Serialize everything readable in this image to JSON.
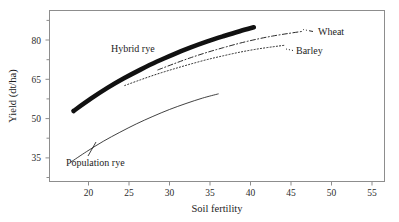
{
  "chart_data": {
    "type": "line",
    "title": "",
    "xlabel": "Soil fertility",
    "ylabel": "Yield (dt/ha)",
    "xlim": [
      16.5,
      57
    ],
    "ylim": [
      29,
      86
    ],
    "xticks": [
      20,
      25,
      30,
      35,
      40,
      45,
      50,
      55
    ],
    "xticklabels": [
      "20",
      "25",
      "30",
      "35",
      "40",
      "45",
      "50",
      "55"
    ],
    "yticks": [
      35,
      50,
      65,
      80
    ],
    "yticklabels": [
      "35",
      "50",
      "65",
      "80"
    ],
    "minor_yticks": [
      42.5,
      57.5,
      72.5
    ],
    "grid": false,
    "legend_position": "inline-annotations",
    "series": [
      {
        "name": "Hybrid rye",
        "style": "thick-solid",
        "color": "#111111",
        "label_x": 27.0,
        "label_y": 70.5,
        "x": [
          19.4,
          21.5,
          23.5,
          25.5,
          27.5,
          29.5,
          31.5,
          33.5,
          35.5,
          37.5,
          39.5,
          41.2
        ],
        "y": [
          52.5,
          56.6,
          60.2,
          63.4,
          66.3,
          69.0,
          71.4,
          73.6,
          75.6,
          77.4,
          79.1,
          80.4
        ]
      },
      {
        "name": "Wheat",
        "style": "dash-dot",
        "color": "#111111",
        "label_x": 48.6,
        "label_y": 80.2,
        "x": [
          29.6,
          31.5,
          33.5,
          35.5,
          37.5,
          39.5,
          41.5,
          43.5,
          45.5,
          47.2
        ],
        "y": [
          66.2,
          68.2,
          70.2,
          72.0,
          73.6,
          75.1,
          76.4,
          77.5,
          78.4,
          79.1
        ]
      },
      {
        "name": "Barley",
        "style": "dotted",
        "color": "#111111",
        "label_x": 46.3,
        "label_y": 75.3,
        "x": [
          25.6,
          27.5,
          29.5,
          31.5,
          33.5,
          35.5,
          37.5,
          39.5,
          41.5,
          43.5,
          44.9
        ],
        "y": [
          61.0,
          62.9,
          64.8,
          66.5,
          68.1,
          69.6,
          70.9,
          72.1,
          73.1,
          73.9,
          74.4
        ]
      },
      {
        "name": "Population rye",
        "style": "thin-solid",
        "color": "#111111",
        "label_x": 21.3,
        "label_y": 33.2,
        "x": [
          19.1,
          21.0,
          23.0,
          25.0,
          27.0,
          29.0,
          31.0,
          33.0,
          35.0,
          36.9
        ],
        "y": [
          35.5,
          39.0,
          42.4,
          45.4,
          48.2,
          50.7,
          53.0,
          55.0,
          56.8,
          58.2
        ]
      }
    ]
  },
  "labels": {
    "xlabel": "Soil fertility",
    "ylabel": "Yield (dt/ha)",
    "hybrid_rye": "Hybrid rye",
    "wheat": "Wheat",
    "barley": "Barley",
    "population_rye": "Population rye",
    "xtick_20": "20",
    "xtick_25": "25",
    "xtick_30": "30",
    "xtick_35": "35",
    "xtick_40": "40",
    "xtick_45": "45",
    "xtick_50": "50",
    "xtick_55": "55",
    "ytick_35": "35",
    "ytick_50": "50",
    "ytick_65": "65",
    "ytick_80": "80"
  },
  "colors": {
    "ink": "#111111",
    "frame": "#8d8d8d",
    "background": "#ffffff"
  }
}
